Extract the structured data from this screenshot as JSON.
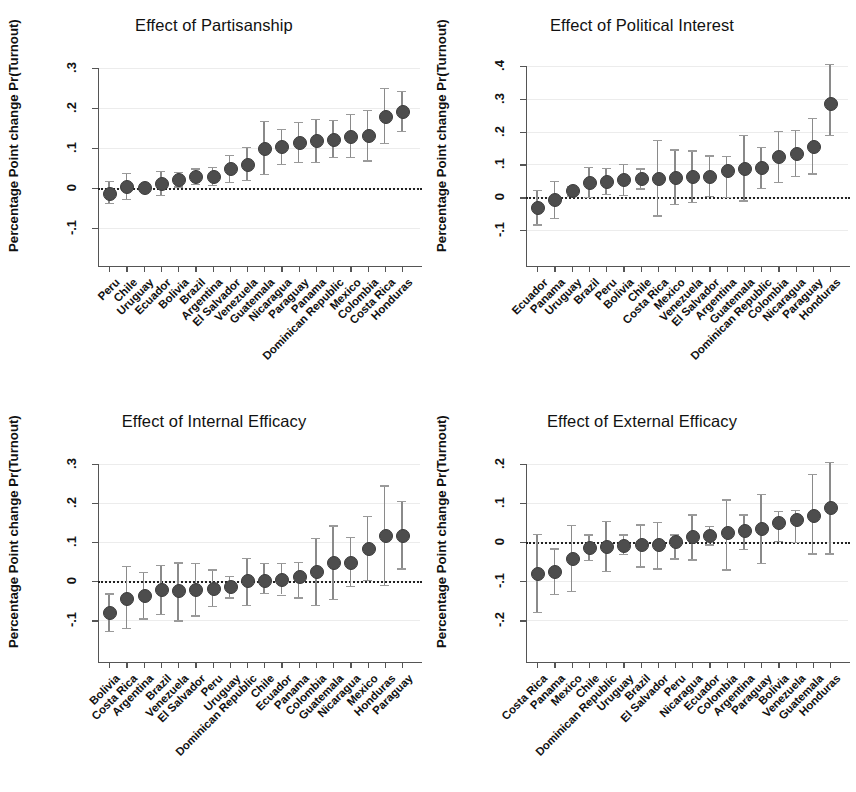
{
  "figure": {
    "width": 856,
    "height": 792,
    "background": "#ffffff",
    "marker_color": "#4d4d4d",
    "ci_color": "#8a8a8a",
    "axis_color": "#555555"
  },
  "chart_data": [
    {
      "type": "scatter",
      "panel": "top-left",
      "title": "Effect of Partisanship",
      "xlabel": "",
      "ylabel": "Percentage Point change Pr(Turnout)",
      "ylim": [
        -0.13,
        0.33
      ],
      "yticks": [
        -0.1,
        0,
        0.1,
        0.2,
        0.3
      ],
      "ytick_labels": [
        "-.1",
        "0",
        ".1",
        ".2",
        ".3"
      ],
      "grid": true,
      "legend": "none",
      "reference_line": 0,
      "categories": [
        "Peru",
        "Chile",
        "Uruguay",
        "Ecuador",
        "Bolivia",
        "Brazil",
        "Argentina",
        "El Salvador",
        "Venezuela",
        "Guatemala",
        "Nicaragua",
        "Paraguay",
        "Panama",
        "Dominican Republic",
        "Mexico",
        "Colombia",
        "Costa Rica",
        "Honduras"
      ],
      "values": [
        -0.012,
        0.004,
        0.003,
        0.013,
        0.022,
        0.029,
        0.03,
        0.049,
        0.061,
        0.101,
        0.104,
        0.114,
        0.119,
        0.123,
        0.131,
        0.132,
        0.181,
        0.192
      ],
      "ci_low": [
        -0.038,
        -0.028,
        -0.004,
        -0.017,
        0.004,
        0.01,
        0.007,
        0.016,
        0.021,
        0.035,
        0.061,
        0.065,
        0.065,
        0.077,
        0.078,
        0.069,
        0.113,
        0.143
      ],
      "ci_high": [
        0.017,
        0.037,
        0.01,
        0.043,
        0.041,
        0.049,
        0.053,
        0.083,
        0.102,
        0.167,
        0.148,
        0.166,
        0.172,
        0.171,
        0.186,
        0.196,
        0.25,
        0.243
      ]
    },
    {
      "type": "scatter",
      "panel": "top-right",
      "title": "Effect of Political Interest",
      "xlabel": "",
      "ylabel": "Percentage Point change Pr(Turnout)",
      "ylim": [
        -0.13,
        0.43
      ],
      "yticks": [
        -0.1,
        0,
        0.1,
        0.2,
        0.3,
        0.4
      ],
      "ytick_labels": [
        "-.1",
        "0",
        ".1",
        ".2",
        ".3",
        ".4"
      ],
      "grid": true,
      "legend": "none",
      "reference_line": 0,
      "categories": [
        "Ecuador",
        "Panama",
        "Uruguay",
        "Brazil",
        "Peru",
        "Bolivia",
        "Chile",
        "Costa Rica",
        "Mexico",
        "Venezuela",
        "El Salvador",
        "Argentina",
        "Guatemala",
        "Dominican Republic",
        "Colombia",
        "Nicaragua",
        "Paraguay",
        "Honduras"
      ],
      "values": [
        -0.03,
        -0.004,
        0.021,
        0.046,
        0.05,
        0.055,
        0.058,
        0.06,
        0.063,
        0.064,
        0.065,
        0.082,
        0.088,
        0.092,
        0.125,
        0.134,
        0.157,
        0.288
      ],
      "ci_low": [
        -0.082,
        -0.062,
        0.006,
        0.001,
        0.01,
        0.008,
        0.027,
        -0.055,
        -0.02,
        -0.014,
        0.005,
        0.001,
        -0.009,
        0.029,
        0.046,
        0.066,
        0.073,
        0.19
      ],
      "ci_high": [
        0.022,
        0.051,
        0.035,
        0.093,
        0.09,
        0.102,
        0.088,
        0.175,
        0.146,
        0.143,
        0.128,
        0.126,
        0.189,
        0.153,
        0.203,
        0.205,
        0.241,
        0.406
      ]
    },
    {
      "type": "scatter",
      "panel": "bottom-left",
      "title": "Effect of Internal Efficacy",
      "xlabel": "",
      "ylabel": "Percentage Point change Pr(Turnout)",
      "ylim": [
        -0.14,
        0.33
      ],
      "yticks": [
        -0.1,
        0,
        0.1,
        0.2,
        0.3
      ],
      "ytick_labels": [
        "-.1",
        "0",
        ".1",
        ".2",
        ".3"
      ],
      "grid": true,
      "legend": "none",
      "reference_line": 0,
      "categories": [
        "Bolivia",
        "Costa Rica",
        "Argentina",
        "Brazil",
        "Venezuela",
        "El Salvador",
        "Peru",
        "Uruguay",
        "Dominican Republic",
        "Chile",
        "Ecuador",
        "Panama",
        "Colombia",
        "Guatemala",
        "Nicaragua",
        "Mexico",
        "Honduras",
        "Paraguay"
      ],
      "values": [
        -0.079,
        -0.042,
        -0.036,
        -0.021,
        -0.022,
        -0.021,
        -0.017,
        -0.013,
        0.002,
        0.004,
        0.006,
        0.012,
        0.026,
        0.048,
        0.05,
        0.084,
        0.118,
        0.119
      ],
      "ci_low": [
        -0.127,
        -0.119,
        -0.095,
        -0.083,
        -0.1,
        -0.087,
        -0.063,
        -0.041,
        -0.061,
        -0.029,
        -0.034,
        -0.041,
        -0.061,
        -0.046,
        -0.012,
        0.003,
        -0.009,
        0.033
      ],
      "ci_high": [
        -0.031,
        0.04,
        0.023,
        0.042,
        0.048,
        0.046,
        0.03,
        0.013,
        0.059,
        0.047,
        0.047,
        0.049,
        0.111,
        0.143,
        0.113,
        0.167,
        0.245,
        0.206
      ]
    },
    {
      "type": "scatter",
      "panel": "bottom-right",
      "title": "Effect of External Efficacy",
      "xlabel": "",
      "ylabel": "Percentage Point change Pr(Turnout)",
      "ylim": [
        -0.24,
        0.23
      ],
      "yticks": [
        -0.2,
        -0.1,
        0,
        0.1,
        0.2
      ],
      "ytick_labels": [
        "-.2",
        "-.1",
        "0",
        ".1",
        ".2"
      ],
      "grid": true,
      "legend": "none",
      "reference_line": 0,
      "categories": [
        "Costa Rica",
        "Panama",
        "Mexico",
        "Chile",
        "Dominican Republic",
        "Uruguay",
        "Brazil",
        "El Salvador",
        "Peru",
        "Nicaragua",
        "Ecuador",
        "Colombia",
        "Argentina",
        "Paraguay",
        "Bolivia",
        "Venezuela",
        "Guatemala",
        "Honduras"
      ],
      "values": [
        -0.079,
        -0.074,
        -0.04,
        -0.012,
        -0.009,
        -0.007,
        -0.006,
        -0.005,
        0.002,
        0.015,
        0.019,
        0.026,
        0.03,
        0.037,
        0.05,
        0.058,
        0.068,
        0.089
      ],
      "ci_low": [
        -0.178,
        -0.133,
        -0.124,
        -0.045,
        -0.073,
        -0.031,
        -0.062,
        -0.067,
        -0.042,
        -0.044,
        -0.006,
        -0.07,
        -0.017,
        -0.054,
        0.003,
        0.001,
        -0.029,
        -0.029
      ],
      "ci_high": [
        0.021,
        -0.016,
        0.044,
        0.02,
        0.054,
        0.02,
        0.045,
        0.051,
        0.02,
        0.071,
        0.041,
        0.109,
        0.071,
        0.123,
        0.08,
        0.082,
        0.174,
        0.205
      ]
    }
  ]
}
